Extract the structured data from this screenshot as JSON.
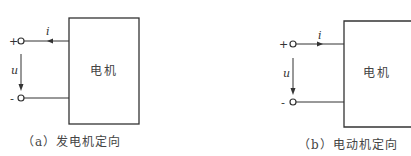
{
  "diagrams": [
    {
      "id": "a",
      "box_label": "电机",
      "plus": "+",
      "minus": "-",
      "current_label": "i",
      "voltage_label": "u",
      "current_direction": "into-terminal",
      "caption": "（a）发电机定向"
    },
    {
      "id": "b",
      "box_label": "电机",
      "plus": "+",
      "minus": "-",
      "current_label": "i",
      "voltage_label": "u",
      "current_direction": "into-box",
      "caption": "（b）电动机定向"
    }
  ]
}
